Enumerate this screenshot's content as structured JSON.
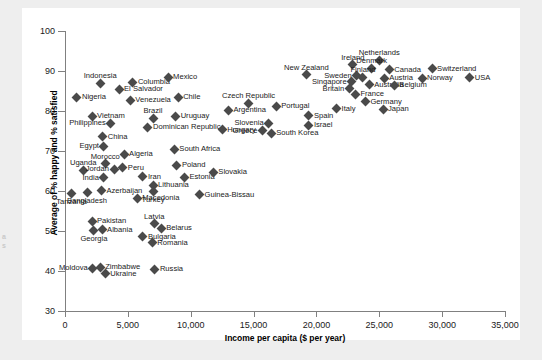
{
  "edge_caption": "a\ns",
  "chart_data": {
    "type": "scatter",
    "title": "",
    "xlabel": "Income per capita ($ per year)",
    "ylabel": "Average of % happy and % satisfied",
    "xlim": [
      0,
      35000
    ],
    "ylim": [
      30,
      100
    ],
    "xticks": [
      "0",
      "5,000",
      "10,000",
      "15,000",
      "20,000",
      "25,000",
      "30,000",
      "35,000"
    ],
    "xtick_values": [
      0,
      5000,
      10000,
      15000,
      20000,
      25000,
      30000,
      35000
    ],
    "yticks": [
      "30",
      "40",
      "50",
      "60",
      "70",
      "80",
      "90",
      "100"
    ],
    "ytick_values": [
      30,
      40,
      50,
      60,
      70,
      80,
      90,
      100
    ],
    "grid": false,
    "legend": "none",
    "marker": "diamond",
    "marker_color": "#4a4a4a",
    "points": [
      {
        "label": "Indonesia",
        "x": 2800,
        "y": 87.0,
        "pos": "above"
      },
      {
        "label": "Nigeria",
        "x": 950,
        "y": 83.5,
        "pos": "right"
      },
      {
        "label": "Columbia",
        "x": 5400,
        "y": 87.2,
        "pos": "right"
      },
      {
        "label": "El Salvador",
        "x": 4300,
        "y": 85.5,
        "pos": "right"
      },
      {
        "label": "Mexico",
        "x": 8200,
        "y": 88.4,
        "pos": "right"
      },
      {
        "label": "Venezuela",
        "x": 5200,
        "y": 82.7,
        "pos": "right"
      },
      {
        "label": "Chile",
        "x": 9000,
        "y": 83.5,
        "pos": "right"
      },
      {
        "label": "Vietnam",
        "x": 2150,
        "y": 78.7,
        "pos": "right"
      },
      {
        "label": "Brazil",
        "x": 7000,
        "y": 78.2,
        "pos": "above"
      },
      {
        "label": "Uruguay",
        "x": 8800,
        "y": 78.7,
        "pos": "right"
      },
      {
        "label": "Philippines",
        "x": 3650,
        "y": 77.0,
        "pos": "left"
      },
      {
        "label": "Dominican Republic",
        "x": 6600,
        "y": 76.0,
        "pos": "right"
      },
      {
        "label": "Hungary",
        "x": 12500,
        "y": 75.3,
        "pos": "right"
      },
      {
        "label": "China",
        "x": 3000,
        "y": 73.6,
        "pos": "right"
      },
      {
        "label": "Egypt",
        "x": 3100,
        "y": 71.2,
        "pos": "left"
      },
      {
        "label": "South Africa",
        "x": 8700,
        "y": 70.5,
        "pos": "right"
      },
      {
        "label": "Algeria",
        "x": 4700,
        "y": 69.2,
        "pos": "right"
      },
      {
        "label": "Morocco",
        "x": 3200,
        "y": 66.8,
        "pos": "above"
      },
      {
        "label": "Uganda",
        "x": 1450,
        "y": 65.2,
        "pos": "above"
      },
      {
        "label": "Jordan",
        "x": 3900,
        "y": 65.5,
        "pos": "left"
      },
      {
        "label": "Peru",
        "x": 4600,
        "y": 65.8,
        "pos": "right"
      },
      {
        "label": "Poland",
        "x": 8900,
        "y": 66.4,
        "pos": "right"
      },
      {
        "label": "India",
        "x": 3100,
        "y": 63.3,
        "pos": "left"
      },
      {
        "label": "Iran",
        "x": 6200,
        "y": 63.6,
        "pos": "right"
      },
      {
        "label": "Estonia",
        "x": 9500,
        "y": 63.5,
        "pos": "right"
      },
      {
        "label": "Slovakia",
        "x": 11800,
        "y": 64.7,
        "pos": "right"
      },
      {
        "label": "Lithuania",
        "x": 7000,
        "y": 61.4,
        "pos": "right"
      },
      {
        "label": "Azerbaijan",
        "x": 2900,
        "y": 60.1,
        "pos": "right"
      },
      {
        "label": "Turkey",
        "x": 7000,
        "y": 59.8,
        "pos": "below"
      },
      {
        "label": "Bangladesh",
        "x": 1750,
        "y": 59.6,
        "pos": "below"
      },
      {
        "label": "Tanzania",
        "x": 520,
        "y": 59.3,
        "pos": "below"
      },
      {
        "label": "Macedonia",
        "x": 5750,
        "y": 58.2,
        "pos": "right"
      },
      {
        "label": "Guinea-Bissau",
        "x": 10700,
        "y": 59.1,
        "pos": "right"
      },
      {
        "label": "Pakistan",
        "x": 2150,
        "y": 52.5,
        "pos": "right"
      },
      {
        "label": "Latvia",
        "x": 7100,
        "y": 51.8,
        "pos": "above"
      },
      {
        "label": "Albania",
        "x": 2950,
        "y": 50.3,
        "pos": "right"
      },
      {
        "label": "Belarus",
        "x": 7650,
        "y": 50.7,
        "pos": "right"
      },
      {
        "label": "Georgia",
        "x": 2300,
        "y": 50.1,
        "pos": "below"
      },
      {
        "label": "Bulgaria",
        "x": 6200,
        "y": 48.6,
        "pos": "right"
      },
      {
        "label": "Romania",
        "x": 6950,
        "y": 47.1,
        "pos": "right"
      },
      {
        "label": "Moldova",
        "x": 2200,
        "y": 40.7,
        "pos": "left"
      },
      {
        "label": "Zimbabwe",
        "x": 2800,
        "y": 40.9,
        "pos": "right"
      },
      {
        "label": "Ukraine",
        "x": 3200,
        "y": 39.3,
        "pos": "right"
      },
      {
        "label": "Russia",
        "x": 7150,
        "y": 40.5,
        "pos": "right"
      },
      {
        "label": "New Zealand",
        "x": 19200,
        "y": 89.1,
        "pos": "above"
      },
      {
        "label": "Czech Republic",
        "x": 14600,
        "y": 81.9,
        "pos": "above"
      },
      {
        "label": "Argentina",
        "x": 13000,
        "y": 80.2,
        "pos": "right"
      },
      {
        "label": "Portugal",
        "x": 16800,
        "y": 81.2,
        "pos": "right"
      },
      {
        "label": "Spain",
        "x": 19400,
        "y": 78.8,
        "pos": "right"
      },
      {
        "label": "Slovenia",
        "x": 16200,
        "y": 77.0,
        "pos": "left"
      },
      {
        "label": "Israel",
        "x": 19400,
        "y": 76.4,
        "pos": "right"
      },
      {
        "label": "Greece",
        "x": 15700,
        "y": 75.1,
        "pos": "left"
      },
      {
        "label": "South Korea",
        "x": 16400,
        "y": 74.5,
        "pos": "right"
      },
      {
        "label": "Ireland",
        "x": 22900,
        "y": 91.6,
        "pos": "above"
      },
      {
        "label": "Netherlands",
        "x": 25000,
        "y": 92.7,
        "pos": "above"
      },
      {
        "label": "Denmark",
        "x": 24400,
        "y": 90.7,
        "pos": "above"
      },
      {
        "label": "Canada",
        "x": 25800,
        "y": 90.3,
        "pos": "right"
      },
      {
        "label": "Switzerland",
        "x": 29200,
        "y": 90.6,
        "pos": "right"
      },
      {
        "label": "Sweden",
        "x": 23200,
        "y": 88.8,
        "pos": "left"
      },
      {
        "label": "Finland",
        "x": 23700,
        "y": 88.4,
        "pos": "above"
      },
      {
        "label": "Austria",
        "x": 25400,
        "y": 88.2,
        "pos": "right"
      },
      {
        "label": "Norway",
        "x": 28400,
        "y": 88.2,
        "pos": "right"
      },
      {
        "label": "USA",
        "x": 32200,
        "y": 88.3,
        "pos": "right"
      },
      {
        "label": "Singapore",
        "x": 22800,
        "y": 87.3,
        "pos": "left"
      },
      {
        "label": "Australia",
        "x": 24200,
        "y": 86.6,
        "pos": "right"
      },
      {
        "label": "Belgium",
        "x": 26200,
        "y": 86.5,
        "pos": "right"
      },
      {
        "label": "Britain",
        "x": 22600,
        "y": 85.6,
        "pos": "left"
      },
      {
        "label": "France",
        "x": 23100,
        "y": 84.2,
        "pos": "right"
      },
      {
        "label": "Germany",
        "x": 23900,
        "y": 82.3,
        "pos": "right"
      },
      {
        "label": "Italy",
        "x": 21600,
        "y": 80.6,
        "pos": "right"
      },
      {
        "label": "Japan",
        "x": 25300,
        "y": 80.4,
        "pos": "right"
      }
    ]
  }
}
